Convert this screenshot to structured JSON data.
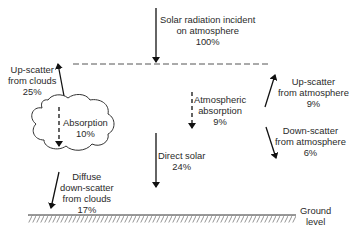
{
  "diagram": {
    "labels": {
      "incident": [
        "Solar radiation incident",
        "on atmosphere",
        "100%"
      ],
      "upscatter_clouds": [
        "Up-scatter",
        "from clouds",
        "25%"
      ],
      "absorption_clouds": [
        "Absorption",
        "10%"
      ],
      "diffuse_clouds": [
        "Diffuse",
        "down-scatter",
        "from clouds",
        "17%"
      ],
      "atmospheric_absorption": [
        "Atmospheric",
        "absorption",
        "9%"
      ],
      "direct_solar": [
        "Direct solar",
        "24%"
      ],
      "upscatter_atmosphere": [
        "Up-scatter",
        "from atmosphere",
        "9%"
      ],
      "downscatter_atmosphere": [
        "Down-scatter",
        "from atmosphere",
        "6%"
      ],
      "ground": [
        "Ground",
        "level"
      ]
    },
    "flows": [
      {
        "name": "Solar radiation incident on atmosphere",
        "percent": 100,
        "direction": "down"
      },
      {
        "name": "Up-scatter from clouds",
        "percent": 25,
        "direction": "up"
      },
      {
        "name": "Absorption (clouds)",
        "percent": 10,
        "direction": "down",
        "style": "dashed"
      },
      {
        "name": "Diffuse down-scatter from clouds",
        "percent": 17,
        "direction": "down"
      },
      {
        "name": "Atmospheric absorption",
        "percent": 9,
        "direction": "down",
        "style": "dashed"
      },
      {
        "name": "Direct solar",
        "percent": 24,
        "direction": "down"
      },
      {
        "name": "Up-scatter from atmosphere",
        "percent": 9,
        "direction": "up"
      },
      {
        "name": "Down-scatter from atmosphere",
        "percent": 6,
        "direction": "down"
      }
    ]
  }
}
